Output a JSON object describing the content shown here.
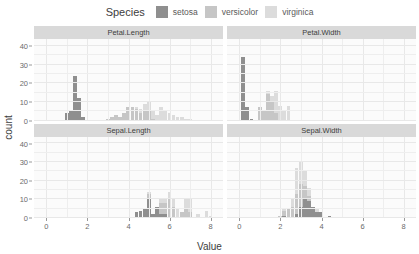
{
  "legend": {
    "title": "Species",
    "items": [
      {
        "label": "setosa",
        "color": "#8f8f8f",
        "icon": "legend-swatch-setosa"
      },
      {
        "label": "versicolor",
        "color": "#c6c6c6",
        "icon": "legend-swatch-versicolor"
      },
      {
        "label": "virginica",
        "color": "#dcdcdc",
        "icon": "legend-swatch-virginica"
      }
    ]
  },
  "axes": {
    "xlabel": "Value",
    "ylabel": "count",
    "xticks": [
      "0",
      "2",
      "4",
      "6",
      "8"
    ],
    "yticks": [
      "0",
      "10",
      "20",
      "30",
      "40"
    ]
  },
  "facet_titles": {
    "petal_length": "Petal.Length",
    "petal_width": "Petal.Width",
    "sepal_length": "Sepal.Length",
    "sepal_width": "Sepal.Width"
  },
  "chart_data": {
    "type": "bar",
    "title": "",
    "subtitle": "",
    "xlabel": "Value",
    "ylabel": "count",
    "xlim": [
      -0.6,
      8.6
    ],
    "ylim": [
      0,
      44
    ],
    "grid": true,
    "legend_position": "top",
    "legend_title": "Species",
    "facet_layout": "2x2",
    "binwidth": 0.2,
    "colors": {
      "setosa": "#8f8f8f",
      "versicolor": "#c6c6c6",
      "virginica": "#dcdcdc"
    },
    "facets": [
      {
        "name": "Petal.Length",
        "row": 0,
        "col": 0,
        "series": [
          {
            "name": "setosa",
            "x": [
              1.0,
              1.2,
              1.4,
              1.6,
              1.8
            ],
            "values": [
              4,
              5,
              24,
              12,
              2
            ]
          },
          {
            "name": "versicolor",
            "x": [
              3.0,
              3.2,
              3.4,
              3.6,
              3.8,
              4.0,
              4.2,
              4.4,
              4.6,
              4.8,
              5.0,
              5.2
            ],
            "values": [
              1,
              2,
              3,
              2,
              4,
              7,
              7,
              6,
              4,
              5,
              5,
              1
            ]
          },
          {
            "name": "virginica",
            "x": [
              4.4,
              4.6,
              4.8,
              5.0,
              5.2,
              5.4,
              5.6,
              5.8,
              6.0,
              6.2,
              6.4,
              6.6,
              6.8,
              7.0
            ],
            "values": [
              1,
              2,
              4,
              5,
              4,
              3,
              7,
              5,
              4,
              3,
              2,
              2,
              1,
              1
            ]
          }
        ]
      },
      {
        "name": "Petal.Width",
        "row": 0,
        "col": 1,
        "series": [
          {
            "name": "setosa",
            "x": [
              0.1,
              0.2,
              0.4,
              0.6
            ],
            "values": [
              5,
              29,
              7,
              1
            ]
          },
          {
            "name": "versicolor",
            "x": [
              1.0,
              1.2,
              1.4,
              1.6,
              1.8
            ],
            "values": [
              7,
              5,
              14,
              10,
              4
            ]
          },
          {
            "name": "virginica",
            "x": [
              1.4,
              1.6,
              1.8,
              2.0,
              2.2,
              2.4
            ],
            "values": [
              2,
              3,
              12,
              8,
              5,
              8
            ]
          }
        ]
      },
      {
        "name": "Sepal.Length",
        "row": 1,
        "col": 0,
        "series": [
          {
            "name": "setosa",
            "x": [
              4.4,
              4.6,
              4.8,
              5.0,
              5.2,
              5.4,
              5.6,
              5.8
            ],
            "values": [
              3,
              4,
              5,
              10,
              2,
              6,
              2,
              2
            ]
          },
          {
            "name": "versicolor",
            "x": [
              4.9,
              5.1,
              5.5,
              5.7,
              5.9,
              6.1,
              6.3,
              6.5,
              6.7,
              6.9,
              7.0
            ],
            "values": [
              1,
              2,
              6,
              6,
              5,
              6,
              6,
              3,
              5,
              2,
              1
            ]
          },
          {
            "name": "virginica",
            "x": [
              4.9,
              5.6,
              5.8,
              6.0,
              6.2,
              6.4,
              6.7,
              6.9,
              7.1,
              7.3,
              7.7,
              7.9
            ],
            "values": [
              1,
              2,
              3,
              3,
              4,
              5,
              5,
              4,
              3,
              2,
              4,
              1
            ]
          }
        ]
      },
      {
        "name": "Sepal.Width",
        "row": 1,
        "col": 1,
        "series": [
          {
            "name": "setosa",
            "x": [
              2.3,
              2.9,
              3.0,
              3.1,
              3.2,
              3.4,
              3.5,
              3.7,
              3.9,
              4.1,
              4.4
            ],
            "values": [
              1,
              2,
              6,
              5,
              5,
              9,
              6,
              3,
              2,
              1,
              1
            ]
          },
          {
            "name": "versicolor",
            "x": [
              2.0,
              2.2,
              2.4,
              2.6,
              2.8,
              3.0,
              3.2,
              3.4
            ],
            "values": [
              1,
              3,
              5,
              6,
              11,
              12,
              7,
              3
            ]
          },
          {
            "name": "virginica",
            "x": [
              2.2,
              2.5,
              2.7,
              2.8,
              3.0,
              3.2,
              3.4,
              3.8
            ],
            "values": [
              1,
              4,
              6,
              8,
              12,
              8,
              4,
              2
            ]
          }
        ]
      }
    ]
  }
}
